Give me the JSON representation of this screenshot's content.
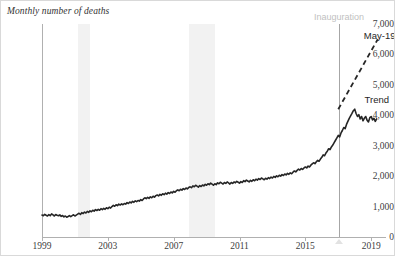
{
  "chart_data": {
    "type": "line",
    "title": "Monthly number of deaths",
    "xlabel": "",
    "ylabel": "",
    "ylim": [
      0,
      7000
    ],
    "xlim": [
      1999.0,
      2019.9
    ],
    "grid": false,
    "legend_position": "inline-annotation",
    "y_ticks": [
      "0",
      "1,000",
      "2,000",
      "3,000",
      "4,000",
      "5,000",
      "6,000",
      "7,000"
    ],
    "y_tick_values": [
      0,
      1000,
      2000,
      3000,
      4000,
      5000,
      6000,
      7000
    ],
    "x_ticks": [
      "1999",
      "2003",
      "2007",
      "2011",
      "2015",
      "2019"
    ],
    "x_tick_values": [
      1999,
      2003,
      2007,
      2011,
      2015,
      2019
    ],
    "annotations": [
      {
        "name": "inauguration",
        "text": "Inauguration",
        "x": 2017.05,
        "color": "#bfbfbf"
      },
      {
        "name": "may-19",
        "text": "May-19",
        "x": 2019.4,
        "y": 6650,
        "color": "#262626"
      },
      {
        "name": "trend",
        "text": "Trend",
        "x": 2018.6,
        "y": 4550,
        "color": "#262626"
      }
    ],
    "shaded_regions": [
      {
        "name": "recession-2001",
        "x_start": 2001.2,
        "x_end": 2001.9,
        "color": "#f2f2f2"
      },
      {
        "name": "recession-2008",
        "x_start": 2007.95,
        "x_end": 2009.5,
        "color": "#f2f2f2"
      }
    ],
    "series": [
      {
        "name": "Monthly deaths",
        "style": "solid",
        "color": "#262626",
        "x": [
          1999.0,
          1999.083,
          1999.167,
          1999.25,
          1999.333,
          1999.417,
          1999.5,
          1999.583,
          1999.667,
          1999.75,
          1999.833,
          1999.917,
          2000.0,
          2000.083,
          2000.167,
          2000.25,
          2000.333,
          2000.417,
          2000.5,
          2000.583,
          2000.667,
          2000.75,
          2000.833,
          2000.917,
          2001.0,
          2001.083,
          2001.167,
          2001.25,
          2001.333,
          2001.417,
          2001.5,
          2001.583,
          2001.667,
          2001.75,
          2001.833,
          2001.917,
          2002.0,
          2002.083,
          2002.167,
          2002.25,
          2002.333,
          2002.417,
          2002.5,
          2002.583,
          2002.667,
          2002.75,
          2002.833,
          2002.917,
          2003.0,
          2003.083,
          2003.167,
          2003.25,
          2003.333,
          2003.417,
          2003.5,
          2003.583,
          2003.667,
          2003.75,
          2003.833,
          2003.917,
          2004.0,
          2004.083,
          2004.167,
          2004.25,
          2004.333,
          2004.417,
          2004.5,
          2004.583,
          2004.667,
          2004.75,
          2004.833,
          2004.917,
          2005.0,
          2005.083,
          2005.167,
          2005.25,
          2005.333,
          2005.417,
          2005.5,
          2005.583,
          2005.667,
          2005.75,
          2005.833,
          2005.917,
          2006.0,
          2006.083,
          2006.167,
          2006.25,
          2006.333,
          2006.417,
          2006.5,
          2006.583,
          2006.667,
          2006.75,
          2006.833,
          2006.917,
          2007.0,
          2007.083,
          2007.167,
          2007.25,
          2007.333,
          2007.417,
          2007.5,
          2007.583,
          2007.667,
          2007.75,
          2007.833,
          2007.917,
          2008.0,
          2008.083,
          2008.167,
          2008.25,
          2008.333,
          2008.417,
          2008.5,
          2008.583,
          2008.667,
          2008.75,
          2008.833,
          2008.917,
          2009.0,
          2009.083,
          2009.167,
          2009.25,
          2009.333,
          2009.417,
          2009.5,
          2009.583,
          2009.667,
          2009.75,
          2009.833,
          2009.917,
          2010.0,
          2010.083,
          2010.167,
          2010.25,
          2010.333,
          2010.417,
          2010.5,
          2010.583,
          2010.667,
          2010.75,
          2010.833,
          2010.917,
          2011.0,
          2011.083,
          2011.167,
          2011.25,
          2011.333,
          2011.417,
          2011.5,
          2011.583,
          2011.667,
          2011.75,
          2011.833,
          2011.917,
          2012.0,
          2012.083,
          2012.167,
          2012.25,
          2012.333,
          2012.417,
          2012.5,
          2012.583,
          2012.667,
          2012.75,
          2012.833,
          2012.917,
          2013.0,
          2013.083,
          2013.167,
          2013.25,
          2013.333,
          2013.417,
          2013.5,
          2013.583,
          2013.667,
          2013.75,
          2013.833,
          2013.917,
          2014.0,
          2014.083,
          2014.167,
          2014.25,
          2014.333,
          2014.417,
          2014.5,
          2014.583,
          2014.667,
          2014.75,
          2014.833,
          2014.917,
          2015.0,
          2015.083,
          2015.167,
          2015.25,
          2015.333,
          2015.417,
          2015.5,
          2015.583,
          2015.667,
          2015.75,
          2015.833,
          2015.917,
          2016.0,
          2016.083,
          2016.167,
          2016.25,
          2016.333,
          2016.417,
          2016.5,
          2016.583,
          2016.667,
          2016.75,
          2016.833,
          2016.917,
          2017.0,
          2017.083,
          2017.167,
          2017.25,
          2017.333,
          2017.417,
          2017.5,
          2017.583,
          2017.667,
          2017.75,
          2017.833,
          2017.917,
          2018.0,
          2018.083,
          2018.167,
          2018.25,
          2018.333,
          2018.417,
          2018.5,
          2018.583,
          2018.667,
          2018.75,
          2018.833,
          2018.917,
          2019.0,
          2019.083,
          2019.167,
          2019.25,
          2019.333
        ],
        "values": [
          720,
          700,
          745,
          715,
          690,
          735,
          700,
          760,
          725,
          690,
          740,
          715,
          700,
          725,
          680,
          705,
          660,
          690,
          650,
          675,
          705,
          670,
          700,
          730,
          690,
          720,
          750,
          780,
          740,
          800,
          770,
          820,
          790,
          840,
          810,
          860,
          830,
          880,
          850,
          900,
          870,
          910,
          880,
          930,
          900,
          940,
          910,
          960,
          930,
          980,
          950,
          1000,
          1040,
          1010,
          1060,
          1030,
          1080,
          1050,
          1090,
          1060,
          1100,
          1080,
          1130,
          1100,
          1150,
          1120,
          1170,
          1140,
          1190,
          1160,
          1200,
          1180,
          1230,
          1200,
          1250,
          1290,
          1260,
          1300,
          1270,
          1320,
          1290,
          1340,
          1310,
          1360,
          1380,
          1350,
          1400,
          1370,
          1420,
          1390,
          1440,
          1410,
          1460,
          1430,
          1480,
          1450,
          1500,
          1470,
          1520,
          1550,
          1520,
          1570,
          1540,
          1590,
          1560,
          1610,
          1580,
          1630,
          1650,
          1620,
          1680,
          1650,
          1700,
          1670,
          1640,
          1690,
          1660,
          1710,
          1680,
          1730,
          1700,
          1750,
          1720,
          1770,
          1740,
          1700,
          1750,
          1720,
          1780,
          1750,
          1800,
          1770,
          1740,
          1790,
          1760,
          1810,
          1780,
          1740,
          1790,
          1760,
          1810,
          1780,
          1830,
          1800,
          1770,
          1820,
          1790,
          1850,
          1820,
          1870,
          1840,
          1810,
          1860,
          1830,
          1880,
          1850,
          1900,
          1870,
          1920,
          1890,
          1940,
          1910,
          1880,
          1930,
          1900,
          1950,
          1920,
          1970,
          1940,
          1990,
          1960,
          2010,
          1980,
          2030,
          2000,
          2050,
          2020,
          2070,
          2040,
          2090,
          2060,
          2110,
          2080,
          2130,
          2170,
          2140,
          2190,
          2230,
          2200,
          2250,
          2220,
          2270,
          2300,
          2270,
          2330,
          2300,
          2360,
          2400,
          2440,
          2410,
          2470,
          2520,
          2490,
          2560,
          2620,
          2700,
          2670,
          2760,
          2820,
          2900,
          2870,
          2960,
          3020,
          3100,
          3180,
          3260,
          3340,
          3290,
          3420,
          3500,
          3600,
          3560,
          3700,
          3800,
          3900,
          3980,
          4060,
          4150,
          4200,
          4060,
          3960,
          4020,
          3880,
          3960,
          3820,
          3900,
          3960,
          3840,
          3780,
          3920,
          3960,
          3850,
          3900,
          3800,
          3880
        ],
        "last_value": 3880,
        "peak_value": 4200
      },
      {
        "name": "Trend",
        "style": "dashed",
        "color": "#262626",
        "x": [
          2017.0,
          2019.4
        ],
        "values": [
          4200,
          6500
        ]
      }
    ]
  }
}
